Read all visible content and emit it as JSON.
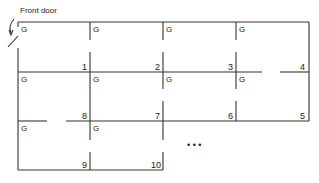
{
  "diagram": {
    "type": "floor-plan",
    "entrance_label": "Front door",
    "ellipsis": "• • •",
    "rooms": [
      {
        "number": "1",
        "marker": "G"
      },
      {
        "number": "2",
        "marker": "G"
      },
      {
        "number": "3",
        "marker": "G"
      },
      {
        "number": "4",
        "marker": "G"
      },
      {
        "number": "5",
        "marker": ""
      },
      {
        "number": "6",
        "marker": "G"
      },
      {
        "number": "7",
        "marker": "G"
      },
      {
        "number": "8",
        "marker": "G"
      },
      {
        "number": "9",
        "marker": "G"
      },
      {
        "number": "10",
        "marker": "G"
      }
    ],
    "row_markers": {
      "row1": [
        "G",
        "G",
        "G",
        "G"
      ],
      "row2": [
        "G",
        "G",
        "G",
        "G"
      ],
      "row3": [
        "G",
        "G"
      ]
    }
  }
}
